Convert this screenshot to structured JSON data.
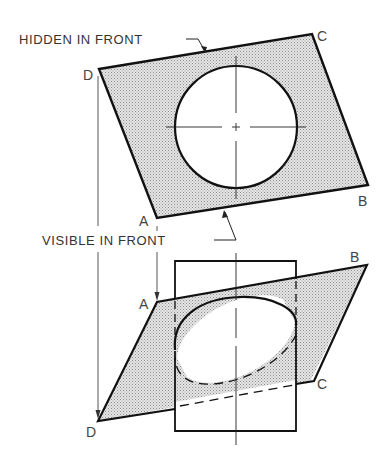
{
  "diagram": {
    "colors": {
      "line": "#111111",
      "shade": "#cfcfcf",
      "text": "#333333",
      "background": "#ffffff"
    },
    "annotations": {
      "hidden": "HIDDEN IN FRONT",
      "visible": "VISIBLE IN FRONT"
    },
    "top_view": {
      "corners": {
        "a": "A",
        "b": "B",
        "c": "C",
        "d": "D"
      }
    },
    "front_view": {
      "corners": {
        "a": "A",
        "b": "B",
        "c": "C",
        "d": "D"
      }
    }
  }
}
